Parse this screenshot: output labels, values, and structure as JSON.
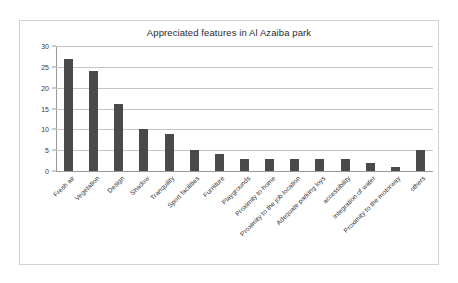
{
  "chart_data": {
    "type": "bar",
    "title": "Appreciated features in Al Azaiba park",
    "xlabel": "",
    "ylabel": "",
    "ylim": [
      0,
      30
    ],
    "ytick_step": 5,
    "yticks": [
      0,
      5,
      10,
      15,
      20,
      25,
      30
    ],
    "grid": true,
    "legend": false,
    "bar_color": "#4a4a4a",
    "categories": [
      "Fresh air",
      "Vegetation",
      "Design",
      "Shadow",
      "Tranquility",
      "Sport facilities",
      "Furniture",
      "Playgrounds",
      "Proximity to home",
      "Proximity to the job location",
      "Adequate parking loys",
      "accessibility",
      "Integration of water",
      "Proximity to the motorway",
      "others"
    ],
    "values": [
      27,
      24,
      16,
      10,
      9,
      5,
      4,
      3,
      3,
      3,
      3,
      3,
      2,
      1,
      5
    ]
  }
}
